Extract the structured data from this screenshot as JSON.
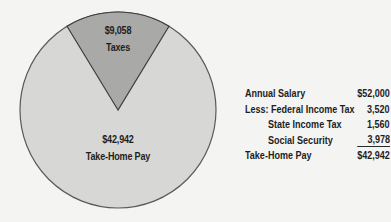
{
  "chart_data": {
    "type": "pie",
    "title": "",
    "total": 52000,
    "slices": [
      {
        "label": "Taxes",
        "value": 9058,
        "display": "$9,058",
        "color": "#a9a9a7"
      },
      {
        "label": "Take-Home Pay",
        "value": 42942,
        "display": "$42,942",
        "color": "#d7d7d5"
      }
    ],
    "outline_color": "#5a5a5a"
  },
  "pie_labels": {
    "taxes": {
      "amount": "$9,058",
      "name": "Taxes"
    },
    "takehome": {
      "amount": "$42,942",
      "name": "Take-Home Pay"
    }
  },
  "table": {
    "rows": [
      {
        "label": "Annual Salary",
        "value": "$52,000",
        "indent": false,
        "underline": false
      },
      {
        "label": "Less: Federal Income Tax",
        "value": "3,520",
        "indent": false,
        "underline": false
      },
      {
        "label": "State Income Tax",
        "value": "1,560",
        "indent": true,
        "underline": false
      },
      {
        "label": "Social Security",
        "value": "3,978",
        "indent": true,
        "underline": true
      },
      {
        "label": "Take-Home Pay",
        "value": "$42,942",
        "indent": false,
        "underline": false
      }
    ]
  }
}
